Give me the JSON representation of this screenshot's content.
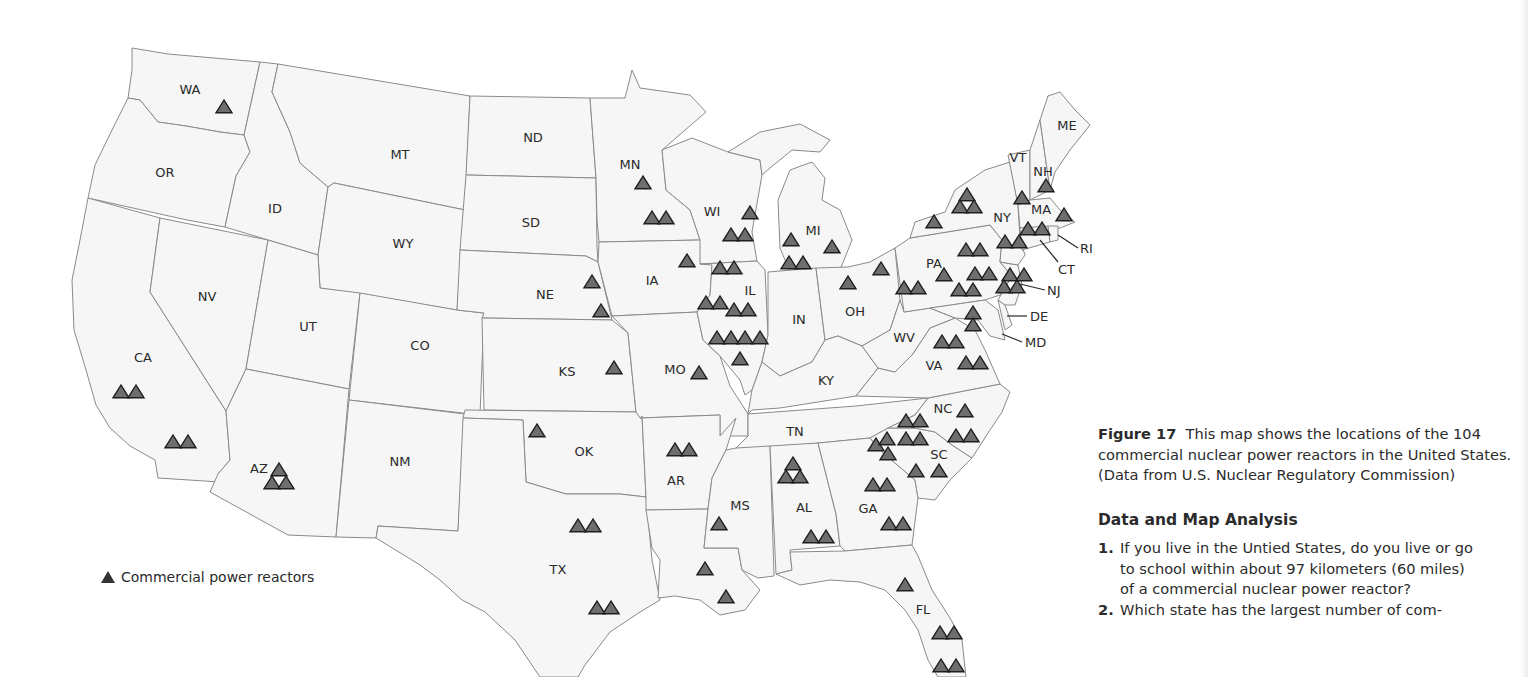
{
  "figure": {
    "label": "Figure 17",
    "caption": "This map shows the locations of the 104 commercial nuclear power reactors in the United States. (Data from U.S. Nuclear Regulatory Commission)",
    "caption_lines": [
      "This map shows the locations of the",
      "104 commercial nuclear power reactors in the",
      "United States. (Data from U.S. Nuclear Regulatory",
      "Commission)"
    ]
  },
  "analysis": {
    "title": "Data and Map Analysis",
    "questions": [
      {
        "num": "1.",
        "lines": [
          "If you live in the Untied States, do you live or go",
          "to school within about 97 kilometers (60 miles)",
          "of a commercial nuclear power reactor?"
        ]
      },
      {
        "num": "2.",
        "lines": [
          "Which state has the largest number of com-"
        ]
      }
    ]
  },
  "legend": {
    "symbol": "triangle",
    "label": "Commercial power reactors"
  },
  "map": {
    "title": "Commercial nuclear power reactors in the United States",
    "total_reactors": 104,
    "colors": {
      "state_fill": "#f6f6f6",
      "state_border": "#8a8a8a",
      "reactor_fill": "#6d6e70",
      "reactor_stroke": "#1e1e1e"
    },
    "state_labels": [
      {
        "abbr": "WA",
        "x": 190,
        "y": 94
      },
      {
        "abbr": "OR",
        "x": 165,
        "y": 177
      },
      {
        "abbr": "CA",
        "x": 143,
        "y": 362
      },
      {
        "abbr": "NV",
        "x": 207,
        "y": 301
      },
      {
        "abbr": "ID",
        "x": 275,
        "y": 213
      },
      {
        "abbr": "MT",
        "x": 400,
        "y": 159
      },
      {
        "abbr": "WY",
        "x": 403,
        "y": 248
      },
      {
        "abbr": "UT",
        "x": 308,
        "y": 331
      },
      {
        "abbr": "CO",
        "x": 420,
        "y": 350
      },
      {
        "abbr": "AZ",
        "x": 259,
        "y": 473
      },
      {
        "abbr": "NM",
        "x": 400,
        "y": 466
      },
      {
        "abbr": "ND",
        "x": 533,
        "y": 142
      },
      {
        "abbr": "SD",
        "x": 531,
        "y": 227
      },
      {
        "abbr": "NE",
        "x": 545,
        "y": 299
      },
      {
        "abbr": "KS",
        "x": 567,
        "y": 376
      },
      {
        "abbr": "OK",
        "x": 584,
        "y": 456
      },
      {
        "abbr": "TX",
        "x": 558,
        "y": 574
      },
      {
        "abbr": "MN",
        "x": 630,
        "y": 169
      },
      {
        "abbr": "IA",
        "x": 652,
        "y": 285
      },
      {
        "abbr": "MO",
        "x": 675,
        "y": 374
      },
      {
        "abbr": "AR",
        "x": 676,
        "y": 485
      },
      {
        "abbr": "WI",
        "x": 712,
        "y": 216
      },
      {
        "abbr": "IL",
        "x": 750,
        "y": 295
      },
      {
        "abbr": "MS",
        "x": 740,
        "y": 510
      },
      {
        "abbr": "MI",
        "x": 813,
        "y": 235
      },
      {
        "abbr": "IN",
        "x": 799,
        "y": 324
      },
      {
        "abbr": "KY",
        "x": 826,
        "y": 385
      },
      {
        "abbr": "TN",
        "x": 795,
        "y": 436
      },
      {
        "abbr": "AL",
        "x": 804,
        "y": 512
      },
      {
        "abbr": "OH",
        "x": 855,
        "y": 316
      },
      {
        "abbr": "GA",
        "x": 868,
        "y": 513
      },
      {
        "abbr": "FL",
        "x": 923,
        "y": 614
      },
      {
        "abbr": "WV",
        "x": 904,
        "y": 342
      },
      {
        "abbr": "VA",
        "x": 934,
        "y": 370
      },
      {
        "abbr": "NC",
        "x": 943,
        "y": 413
      },
      {
        "abbr": "SC",
        "x": 939,
        "y": 459
      },
      {
        "abbr": "PA",
        "x": 934,
        "y": 268
      },
      {
        "abbr": "NY",
        "x": 1002,
        "y": 222
      },
      {
        "abbr": "VT",
        "x": 1018,
        "y": 162
      },
      {
        "abbr": "NH",
        "x": 1043,
        "y": 176
      },
      {
        "abbr": "ME",
        "x": 1067,
        "y": 130
      },
      {
        "abbr": "MA",
        "x": 1041,
        "y": 214
      }
    ],
    "callout_labels": [
      {
        "abbr": "RI",
        "x": 1080,
        "y": 253
      },
      {
        "abbr": "CT",
        "x": 1058,
        "y": 274
      },
      {
        "abbr": "NJ",
        "x": 1047,
        "y": 295
      },
      {
        "abbr": "DE",
        "x": 1030,
        "y": 321
      },
      {
        "abbr": "MD",
        "x": 1025,
        "y": 347
      }
    ]
  },
  "chart_data": {
    "type": "map",
    "title": "Locations of the 104 commercial nuclear power reactors in the United States",
    "source": "U.S. Nuclear Regulatory Commission",
    "legend": [
      "Commercial power reactors"
    ],
    "reactors_by_state": {
      "WA": 1,
      "CA": 4,
      "AZ": 3,
      "TX": 4,
      "KS": 1,
      "NE": 2,
      "MN": 3,
      "IA": 1,
      "MO": 1,
      "AR": 2,
      "LA": 2,
      "MS": 1,
      "WI": 3,
      "IL": 11,
      "MI": 4,
      "OH": 2,
      "AL": 5,
      "TN": 0,
      "GA": 4,
      "FL": 5,
      "SC": 7,
      "NC": 5,
      "VA": 4,
      "MD": 2,
      "PA": 9,
      "NY": 6,
      "NJ": 4,
      "CT": 2,
      "MA": 1,
      "NH": 1,
      "VT": 1
    },
    "reactor_points": [
      {
        "state": "WA",
        "x": 224,
        "y": 108
      },
      {
        "state": "CA",
        "x": 121,
        "y": 393
      },
      {
        "state": "CA",
        "x": 136,
        "y": 393
      },
      {
        "state": "CA",
        "x": 173,
        "y": 443
      },
      {
        "state": "CA",
        "x": 188,
        "y": 443
      },
      {
        "state": "AZ",
        "x": 279,
        "y": 471
      },
      {
        "state": "AZ",
        "x": 272,
        "y": 484
      },
      {
        "state": "AZ",
        "x": 286,
        "y": 484
      },
      {
        "state": "NE",
        "x": 592,
        "y": 283
      },
      {
        "state": "NE",
        "x": 601,
        "y": 312
      },
      {
        "state": "KS",
        "x": 614,
        "y": 369
      },
      {
        "state": "MN",
        "x": 643,
        "y": 184
      },
      {
        "state": "MN",
        "x": 652,
        "y": 219
      },
      {
        "state": "MN",
        "x": 666,
        "y": 219
      },
      {
        "state": "IA",
        "x": 687,
        "y": 262
      },
      {
        "state": "MO",
        "x": 699,
        "y": 374
      },
      {
        "state": "WI",
        "x": 750,
        "y": 214
      },
      {
        "state": "WI",
        "x": 731,
        "y": 236
      },
      {
        "state": "WI",
        "x": 745,
        "y": 236
      },
      {
        "state": "IL",
        "x": 720,
        "y": 269
      },
      {
        "state": "IL",
        "x": 734,
        "y": 269
      },
      {
        "state": "IL",
        "x": 706,
        "y": 304
      },
      {
        "state": "IL",
        "x": 720,
        "y": 304
      },
      {
        "state": "IL",
        "x": 734,
        "y": 311
      },
      {
        "state": "IL",
        "x": 748,
        "y": 311
      },
      {
        "state": "IL",
        "x": 717,
        "y": 339
      },
      {
        "state": "IL",
        "x": 731,
        "y": 339
      },
      {
        "state": "IL",
        "x": 745,
        "y": 339
      },
      {
        "state": "IL",
        "x": 760,
        "y": 339
      },
      {
        "state": "IL",
        "x": 740,
        "y": 360
      },
      {
        "state": "MI",
        "x": 791,
        "y": 241
      },
      {
        "state": "MI",
        "x": 832,
        "y": 248
      },
      {
        "state": "MI",
        "x": 789,
        "y": 264
      },
      {
        "state": "MI",
        "x": 803,
        "y": 264
      },
      {
        "state": "OH",
        "x": 848,
        "y": 284
      },
      {
        "state": "OH",
        "x": 881,
        "y": 270
      },
      {
        "state": "OK",
        "x": 537,
        "y": 432
      },
      {
        "state": "AR",
        "x": 675,
        "y": 451
      },
      {
        "state": "AR",
        "x": 689,
        "y": 451
      },
      {
        "state": "TX",
        "x": 578,
        "y": 527
      },
      {
        "state": "TX",
        "x": 593,
        "y": 527
      },
      {
        "state": "TX",
        "x": 597,
        "y": 609
      },
      {
        "state": "TX",
        "x": 611,
        "y": 609
      },
      {
        "state": "LA",
        "x": 705,
        "y": 570
      },
      {
        "state": "LA",
        "x": 726,
        "y": 598
      },
      {
        "state": "MS",
        "x": 719,
        "y": 525
      },
      {
        "state": "AL",
        "x": 793,
        "y": 465
      },
      {
        "state": "AL",
        "x": 786,
        "y": 478
      },
      {
        "state": "AL",
        "x": 800,
        "y": 478
      },
      {
        "state": "AL",
        "x": 811,
        "y": 538
      },
      {
        "state": "AL",
        "x": 826,
        "y": 538
      },
      {
        "state": "GA",
        "x": 873,
        "y": 486
      },
      {
        "state": "GA",
        "x": 887,
        "y": 486
      },
      {
        "state": "GA",
        "x": 889,
        "y": 525
      },
      {
        "state": "GA",
        "x": 903,
        "y": 525
      },
      {
        "state": "GA",
        "x": 876,
        "y": 446
      },
      {
        "state": "GA",
        "x": 888,
        "y": 455
      },
      {
        "state": "SC",
        "x": 887,
        "y": 440
      },
      {
        "state": "SC",
        "x": 906,
        "y": 440
      },
      {
        "state": "SC",
        "x": 920,
        "y": 440
      },
      {
        "state": "SC",
        "x": 916,
        "y": 472
      },
      {
        "state": "SC",
        "x": 939,
        "y": 472
      },
      {
        "state": "NC",
        "x": 906,
        "y": 422
      },
      {
        "state": "NC",
        "x": 920,
        "y": 422
      },
      {
        "state": "NC",
        "x": 965,
        "y": 412
      },
      {
        "state": "NC",
        "x": 956,
        "y": 437
      },
      {
        "state": "NC",
        "x": 971,
        "y": 437
      },
      {
        "state": "FL",
        "x": 905,
        "y": 586
      },
      {
        "state": "FL",
        "x": 940,
        "y": 634
      },
      {
        "state": "FL",
        "x": 954,
        "y": 634
      },
      {
        "state": "FL",
        "x": 941,
        "y": 667
      },
      {
        "state": "FL",
        "x": 956,
        "y": 667
      },
      {
        "state": "VA",
        "x": 942,
        "y": 343
      },
      {
        "state": "VA",
        "x": 956,
        "y": 343
      },
      {
        "state": "VA",
        "x": 966,
        "y": 364
      },
      {
        "state": "VA",
        "x": 980,
        "y": 364
      },
      {
        "state": "MD",
        "x": 973,
        "y": 314
      },
      {
        "state": "MD",
        "x": 973,
        "y": 326
      },
      {
        "state": "PA",
        "x": 904,
        "y": 289
      },
      {
        "state": "PA",
        "x": 918,
        "y": 289
      },
      {
        "state": "PA",
        "x": 944,
        "y": 276
      },
      {
        "state": "PA",
        "x": 966,
        "y": 251
      },
      {
        "state": "PA",
        "x": 980,
        "y": 251
      },
      {
        "state": "PA",
        "x": 975,
        "y": 275
      },
      {
        "state": "PA",
        "x": 989,
        "y": 275
      },
      {
        "state": "PA",
        "x": 959,
        "y": 291
      },
      {
        "state": "PA",
        "x": 973,
        "y": 291
      },
      {
        "state": "NY",
        "x": 934,
        "y": 223
      },
      {
        "state": "NY",
        "x": 967,
        "y": 196
      },
      {
        "state": "NY",
        "x": 960,
        "y": 208
      },
      {
        "state": "NY",
        "x": 974,
        "y": 208
      },
      {
        "state": "NY",
        "x": 1005,
        "y": 243
      },
      {
        "state": "NY",
        "x": 1019,
        "y": 243
      },
      {
        "state": "NJ",
        "x": 1010,
        "y": 276
      },
      {
        "state": "NJ",
        "x": 1024,
        "y": 276
      },
      {
        "state": "NJ",
        "x": 1004,
        "y": 288
      },
      {
        "state": "NJ",
        "x": 1017,
        "y": 288
      },
      {
        "state": "CT",
        "x": 1028,
        "y": 230
      },
      {
        "state": "CT",
        "x": 1042,
        "y": 230
      },
      {
        "state": "VT",
        "x": 1022,
        "y": 199
      },
      {
        "state": "NH",
        "x": 1046,
        "y": 187
      },
      {
        "state": "MA",
        "x": 1064,
        "y": 216
      }
    ]
  }
}
